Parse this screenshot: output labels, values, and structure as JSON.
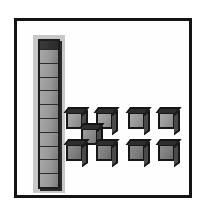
{
  "figure": {
    "background_color": "#ffffff",
    "frame_border_color": "#141414",
    "canvas_color": "#fefefe",
    "selection_highlight_color": "#c3c3c3",
    "cube_face_color": "#9a9a9a",
    "cube_outline_color": "#161616",
    "cube_top_face_color": "#2e2e2e"
  },
  "column": {
    "label": "selected cube column",
    "segment_count": 10,
    "selected": true,
    "orientation": "vertical",
    "segments": [
      {
        "index": 1
      },
      {
        "index": 2
      },
      {
        "index": 3
      },
      {
        "index": 4
      },
      {
        "index": 5
      },
      {
        "index": 6
      },
      {
        "index": 7
      },
      {
        "index": 8
      },
      {
        "index": 9
      },
      {
        "index": 10
      }
    ]
  },
  "cube_groups": [
    {
      "name": "plus-cluster",
      "cube_count": 5,
      "cubes": [
        {
          "id": "plus-top-left",
          "x": 66,
          "y": 112,
          "variant": "normal"
        },
        {
          "id": "plus-top-right",
          "x": 96,
          "y": 112,
          "variant": "normal"
        },
        {
          "id": "plus-center",
          "x": 81,
          "y": 128,
          "variant": "center"
        },
        {
          "id": "plus-bottom-left",
          "x": 66,
          "y": 144,
          "variant": "dim"
        },
        {
          "id": "plus-bottom-right",
          "x": 96,
          "y": 144,
          "variant": "dim"
        }
      ]
    },
    {
      "name": "pair-grid",
      "cube_count": 4,
      "cubes": [
        {
          "id": "grid-top-left",
          "x": 128,
          "y": 112,
          "variant": "normal"
        },
        {
          "id": "grid-top-right",
          "x": 158,
          "y": 112,
          "variant": "normal"
        },
        {
          "id": "grid-bottom-left",
          "x": 128,
          "y": 144,
          "variant": "dim"
        },
        {
          "id": "grid-bottom-right",
          "x": 158,
          "y": 144,
          "variant": "dim"
        }
      ]
    }
  ]
}
